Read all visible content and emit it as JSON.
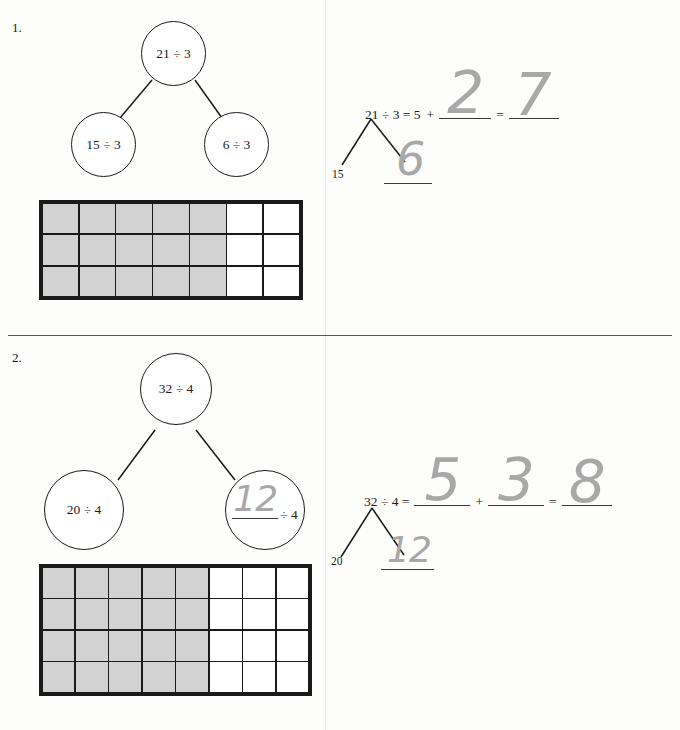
{
  "page": {
    "width": 680,
    "height": 730,
    "background": "#fdfdfc",
    "ink_color": "#1a1a1a",
    "pencil_color": "#a8a8a8",
    "shaded_cell_color": "#d2d2d2"
  },
  "problems": [
    {
      "number": "1.",
      "bond": {
        "parent": "21 ÷ 3",
        "left_child": "15 ÷ 3",
        "right_child": "6 ÷ 3",
        "right_child_handwritten": null
      },
      "array": {
        "columns": 7,
        "rows": 3,
        "shaded_columns": 5,
        "total_cells": 21,
        "shaded_cells": 15
      },
      "equation": {
        "lead": "21 ÷ 3 = 5",
        "plus": "+",
        "blank1_answer": "2",
        "equals": "=",
        "blank2_answer": "7"
      },
      "sub_bond": {
        "left_label": "15",
        "right_blank_answer": "6"
      }
    },
    {
      "number": "2.",
      "bond": {
        "parent": "32 ÷ 4",
        "left_child": "20 ÷ 4",
        "right_child_suffix": "÷ 4",
        "right_child_handwritten": "12"
      },
      "array": {
        "columns": 8,
        "rows": 4,
        "shaded_columns": 5,
        "total_cells": 32,
        "shaded_cells": 20
      },
      "equation": {
        "lead": "32 ÷ 4 =",
        "blank1_answer": "5",
        "plus": "+",
        "blank2_answer": "3",
        "equals": "=",
        "blank3_answer": "8"
      },
      "sub_bond": {
        "left_label": "20",
        "right_blank_answer": "12"
      }
    }
  ]
}
